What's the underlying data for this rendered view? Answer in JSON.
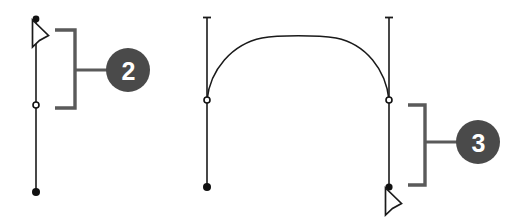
{
  "canvas": {
    "width": 528,
    "height": 223,
    "background_color": "#ffffff",
    "stroke_color": "#1a1a1a",
    "callout_color": "#4a4a4a",
    "callout_text_color": "#ffffff"
  },
  "figures": [
    {
      "id": "figure-step-2",
      "callout": {
        "label": "2",
        "cx": 128,
        "cy": 70,
        "r": 22,
        "leader_x1": 75,
        "leader_y1": 70,
        "leader_x2": 106,
        "leader_y2": 70
      },
      "bracket": {
        "spine_x": 75,
        "top_y": 30,
        "bottom_y": 108,
        "arm_x": 55,
        "orientation": "arms-left"
      },
      "paths": [
        {
          "name": "vertical-segment-left",
          "x": 36,
          "y_top": 19,
          "y_bottom": 192
        }
      ],
      "anchors": [
        {
          "name": "anchor-point-open",
          "type": "open-circle",
          "x": 36,
          "y": 105,
          "r": 3
        },
        {
          "name": "anchor-point-filled",
          "type": "filled-dot",
          "x": 36,
          "y": 192,
          "r": 4
        },
        {
          "name": "anchor-point-selected",
          "type": "filled-dot",
          "x": 36,
          "y": 19,
          "r": 3.5
        }
      ],
      "cursor": {
        "name": "arrow-cursor",
        "x": 34,
        "y": 22,
        "direction": "up-left"
      },
      "end_cap": null
    },
    {
      "id": "figure-step-3",
      "callout": {
        "label": "3",
        "cx": 478,
        "cy": 142,
        "r": 22,
        "leader_x1": 425,
        "leader_y1": 142,
        "leader_x2": 456,
        "leader_y2": 142
      },
      "bracket": {
        "spine_x": 425,
        "top_y": 105,
        "bottom_y": 185,
        "arm_x": 408,
        "orientation": "arms-left"
      },
      "paths": [
        {
          "name": "vertical-segment-left",
          "x": 207,
          "y_top": 17,
          "y_bottom": 187
        },
        {
          "name": "vertical-segment-right",
          "x": 389,
          "y_top": 17,
          "y_bottom": 187
        },
        {
          "name": "arch-curve",
          "start_x": 207,
          "start_y": 100,
          "end_x": 389,
          "end_y": 100,
          "peak_x": 298,
          "peak_y": 37
        }
      ],
      "anchors": [
        {
          "name": "anchor-point-open-left",
          "type": "open-circle",
          "x": 207,
          "y": 100,
          "r": 3
        },
        {
          "name": "anchor-point-open-right",
          "type": "open-circle",
          "x": 389,
          "y": 100,
          "r": 3
        },
        {
          "name": "anchor-point-filled-left",
          "type": "filled-dot",
          "x": 207,
          "y": 187,
          "r": 4
        },
        {
          "name": "anchor-point-filled-right",
          "type": "filled-dot",
          "x": 389,
          "y": 187,
          "r": 4
        }
      ],
      "cursor": {
        "name": "arrow-cursor",
        "x": 387,
        "y": 189,
        "direction": "up-left"
      },
      "end_caps": [
        {
          "name": "top-cap-left",
          "x": 207,
          "y": 17,
          "half_width": 4
        },
        {
          "name": "top-cap-right",
          "x": 389,
          "y": 17,
          "half_width": 4
        }
      ]
    }
  ]
}
